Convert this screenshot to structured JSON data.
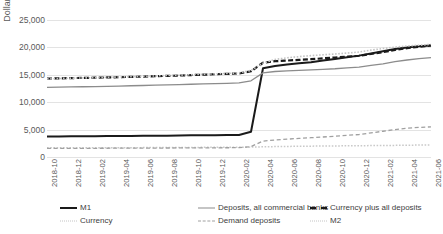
{
  "chart_data": {
    "type": "line",
    "title": "",
    "xlabel": "",
    "ylabel": "Dollar billions",
    "ylim": [
      0,
      25000
    ],
    "yticks": [
      0,
      5000,
      10000,
      15000,
      20000,
      25000
    ],
    "ytick_labels": [
      "0",
      "5,000",
      "10,000",
      "15,000",
      "20,000",
      "25,000"
    ],
    "grid": true,
    "legend_position": "bottom",
    "x": [
      "2018-10",
      "2018-11",
      "2018-12",
      "2019-01",
      "2019-02",
      "2019-03",
      "2019-04",
      "2019-05",
      "2019-06",
      "2019-07",
      "2019-08",
      "2019-09",
      "2019-10",
      "2019-11",
      "2019-12",
      "2020-01",
      "2020-02",
      "2020-03",
      "2020-04",
      "2020-05",
      "2020-06",
      "2020-07",
      "2020-08",
      "2020-09",
      "2020-10",
      "2020-11",
      "2020-12",
      "2021-01",
      "2021-02",
      "2021-03",
      "2021-04",
      "2021-05",
      "2021-06"
    ],
    "xtick_labels": [
      "2018-10",
      "2018-12",
      "2019-02",
      "2019-04",
      "2019-06",
      "2019-08",
      "2019-10",
      "2019-12",
      "2020-02",
      "2020-04",
      "2020-06",
      "2020-08",
      "2020-10",
      "2020-12",
      "2021-02",
      "2021-04",
      "2021-06"
    ],
    "series": [
      {
        "name": "M1",
        "style": "solid",
        "color": "#1a1a1a",
        "width": 2,
        "values": [
          3750,
          3760,
          3780,
          3790,
          3800,
          3810,
          3830,
          3840,
          3860,
          3880,
          3900,
          3930,
          3960,
          3980,
          3990,
          4000,
          4020,
          4600,
          16200,
          16600,
          16900,
          17100,
          17300,
          17600,
          17900,
          18200,
          18500,
          18900,
          19300,
          19700,
          20000,
          20200,
          20350
        ]
      },
      {
        "name": "Currency",
        "style": "dotted",
        "color": "#c9c9c9",
        "width": 1.5,
        "values": [
          1670,
          1675,
          1680,
          1685,
          1690,
          1695,
          1700,
          1705,
          1712,
          1720,
          1730,
          1740,
          1750,
          1760,
          1770,
          1780,
          1790,
          1805,
          1860,
          1900,
          1930,
          1960,
          1980,
          2000,
          2020,
          2040,
          2060,
          2080,
          2100,
          2120,
          2150,
          2180,
          2200
        ]
      },
      {
        "name": "Deposits, all commercial banks",
        "style": "solid",
        "color": "#8c8c8c",
        "width": 1.3,
        "values": [
          12700,
          12750,
          12800,
          12820,
          12860,
          12900,
          12950,
          13000,
          13050,
          13100,
          13150,
          13200,
          13280,
          13340,
          13400,
          13450,
          13520,
          13900,
          15350,
          15600,
          15700,
          15800,
          15900,
          16000,
          16100,
          16250,
          16400,
          16700,
          17000,
          17400,
          17700,
          17950,
          18150
        ]
      },
      {
        "name": "Demand deposits",
        "style": "dashed",
        "color": "#a0a0a0",
        "width": 1.3,
        "values": [
          1560,
          1570,
          1580,
          1585,
          1590,
          1600,
          1610,
          1615,
          1620,
          1630,
          1640,
          1650,
          1660,
          1670,
          1680,
          1690,
          1700,
          1900,
          2900,
          3100,
          3250,
          3400,
          3520,
          3650,
          3800,
          3950,
          4100,
          4400,
          4700,
          5000,
          5250,
          5400,
          5500
        ]
      },
      {
        "name": "Currency plus all deposits",
        "style": "dashed",
        "color": "#1a1a1a",
        "width": 2.2,
        "values": [
          14300,
          14350,
          14400,
          14430,
          14470,
          14520,
          14570,
          14620,
          14680,
          14740,
          14800,
          14860,
          14950,
          15020,
          15100,
          15170,
          15250,
          15650,
          17200,
          17480,
          17600,
          17720,
          17850,
          18000,
          18150,
          18320,
          18480,
          18800,
          19130,
          19550,
          19870,
          20130,
          20350
        ]
      },
      {
        "name": "M2",
        "style": "dotted",
        "color": "#c4c4c4",
        "width": 1.6,
        "values": [
          14250,
          14320,
          14390,
          14430,
          14480,
          14540,
          14600,
          14660,
          14720,
          14790,
          14860,
          14930,
          15020,
          15100,
          15180,
          15260,
          15350,
          15800,
          17100,
          17800,
          18100,
          18320,
          18500,
          18650,
          18800,
          18970,
          19150,
          19500,
          19800,
          20050,
          20250,
          20400,
          20550
        ]
      }
    ]
  },
  "legend": [
    {
      "label": "M1",
      "swatch": "sw-solid-dark"
    },
    {
      "label": "Currency",
      "swatch": "sw-dot-light"
    },
    {
      "label": "Deposits, all commercial banks",
      "swatch": "sw-solid-gray"
    },
    {
      "label": "Demand deposits",
      "swatch": "sw-dash-gray"
    },
    {
      "label": "Currency plus all deposits",
      "swatch": "sw-dash-dark"
    },
    {
      "label": "M2",
      "swatch": "sw-dot-light2"
    }
  ]
}
